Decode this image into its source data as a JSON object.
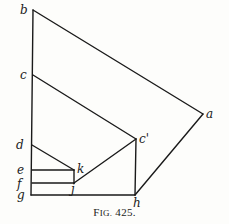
{
  "figure": {
    "caption": "Fig. 425.",
    "caption_prefix": "F",
    "caption_smallcaps": "IG.",
    "caption_number": "425."
  },
  "diagram": {
    "stroke_color": "#1a1a1a",
    "points": {
      "b": {
        "label": "b",
        "x": 33,
        "y": 10
      },
      "c": {
        "label": "c",
        "x": 33,
        "y": 75
      },
      "d": {
        "label": "d",
        "x": 32,
        "y": 145
      },
      "e": {
        "label": "e",
        "x": 32,
        "y": 170
      },
      "f": {
        "label": "f",
        "x": 32,
        "y": 183
      },
      "g": {
        "label": "g",
        "x": 31,
        "y": 195
      },
      "a": {
        "label": "a",
        "x": 203,
        "y": 114
      },
      "c_prime": {
        "label": "c'",
        "x": 136,
        "y": 139
      },
      "k": {
        "label": "k",
        "x": 74,
        "y": 170
      },
      "j": {
        "label": "j",
        "x": 74,
        "y": 183
      },
      "h": {
        "label": "h",
        "x": 135,
        "y": 195
      }
    },
    "labels": [
      {
        "id": "b",
        "text": "b"
      },
      {
        "id": "c",
        "text": "c"
      },
      {
        "id": "d",
        "text": "d"
      },
      {
        "id": "e",
        "text": "e"
      },
      {
        "id": "f",
        "text": "f"
      },
      {
        "id": "g",
        "text": "g"
      },
      {
        "id": "a",
        "text": "a"
      },
      {
        "id": "c_prime",
        "text": "c'"
      },
      {
        "id": "k",
        "text": "k"
      },
      {
        "id": "j",
        "text": "j"
      },
      {
        "id": "h",
        "text": "h"
      }
    ]
  }
}
